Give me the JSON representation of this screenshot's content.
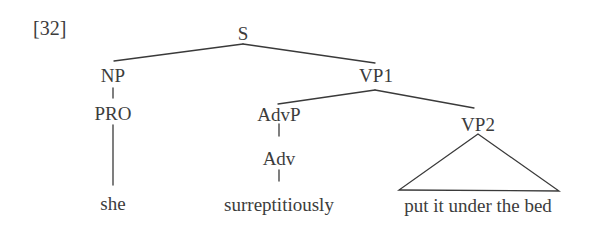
{
  "example_number": "[32]",
  "tree": {
    "root": {
      "label": "S",
      "children": [
        {
          "label": "NP",
          "children": [
            {
              "label": "PRO",
              "children": [
                {
                  "label": "she",
                  "terminal": true
                }
              ]
            }
          ]
        },
        {
          "label": "VP1",
          "children": [
            {
              "label": "AdvP",
              "children": [
                {
                  "label": "Adv",
                  "children": [
                    {
                      "label": "surreptitiously",
                      "terminal": true
                    }
                  ]
                }
              ]
            },
            {
              "label": "VP2",
              "triangle": true,
              "children": [
                {
                  "label": "put it under the bed",
                  "terminal": true
                }
              ]
            }
          ]
        }
      ]
    }
  },
  "labels": {
    "s": "S",
    "np": "NP",
    "pro": "PRO",
    "she": "she",
    "vp1": "VP1",
    "advp": "AdvP",
    "adv": "Adv",
    "surreptitiously": "surreptitiously",
    "vp2": "VP2",
    "vp2_terminal": "put it under the bed"
  },
  "colors": {
    "line": "#3a3a3a",
    "text": "#3c3c3c",
    "background": "#ffffff"
  }
}
